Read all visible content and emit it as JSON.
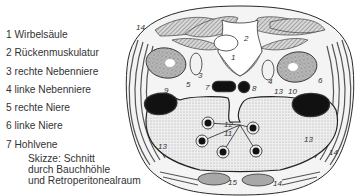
{
  "legend": {
    "items": [
      {
        "number": "1",
        "label": "1 Wirbelsäule"
      },
      {
        "number": "2",
        "label": "2 Rückenmuskulatur"
      },
      {
        "number": "3",
        "label": "3 rechte Nebenniere"
      },
      {
        "number": "4",
        "label": "4 linke Nebenniere"
      },
      {
        "number": "5",
        "label": "5 rechte Niere"
      },
      {
        "number": "6",
        "label": "6 linke Niere"
      },
      {
        "number": "7",
        "label": "7 Hohlvene"
      }
    ]
  },
  "caption": {
    "line1": "Skizze: Schnitt",
    "line2": "durch Bauchhöhle",
    "line3": "und Retroperitonealraum"
  },
  "diagram": {
    "labels": {
      "n1": "1",
      "n2": "2",
      "n3": "3",
      "n4": "4",
      "n5": "5",
      "n6": "6",
      "n7": "7",
      "n8": "8",
      "n9": "9",
      "n10": "10",
      "n11": "11",
      "n12": "12",
      "n13a": "13",
      "n13b": "13",
      "n13c": "13",
      "n14a": "14",
      "n14b": "14",
      "n14c": "14",
      "n15": "15"
    },
    "colors": {
      "outline": "#2a2a2a",
      "muscle_hatch": "#8a8a8a",
      "cavity_stipple": "#e4e4e4",
      "organ_dark": "#111111",
      "rectus_fill": "#a8a8a8"
    }
  }
}
